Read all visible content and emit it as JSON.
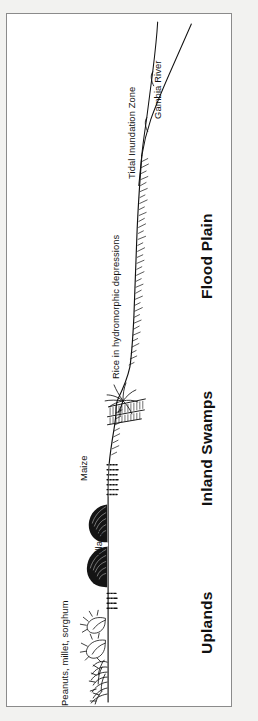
{
  "figure": {
    "orientation": "rotated-90-ccw",
    "type": "landscape cross-section profile",
    "background_color": "#ffffff",
    "page_color": "#f2f2f0",
    "frame_color": "#8b8b8b",
    "ink_color": "#111111"
  },
  "feature_labels": [
    {
      "id": "gambia-river",
      "text": "Gambia River"
    },
    {
      "id": "tidal-inundation",
      "text": "Tidal Inundation Zone"
    },
    {
      "id": "rice-depressions",
      "text": "Rice in hydromorphic depressions"
    },
    {
      "id": "maize",
      "text": "Maize"
    },
    {
      "id": "village",
      "text": "Village"
    },
    {
      "id": "peanuts-millet",
      "text": "Peanuts, millet, sorghum"
    }
  ],
  "zone_labels": [
    {
      "id": "flood-plain",
      "text": "Flood Plain"
    },
    {
      "id": "inland-swamps",
      "text": "Inland Swamps"
    },
    {
      "id": "uplands",
      "text": "Uplands"
    }
  ],
  "icons": {
    "palm_tree": "palm-tree-icon",
    "hut": "village-hut-icon",
    "shrub": "shrub-icon",
    "crop_rows": "crop-rows-icon",
    "grass_hatch": "grass-hatching-icon",
    "river_bank": "river-bank-line-icon",
    "terrain": "terrain-profile-line-icon"
  }
}
